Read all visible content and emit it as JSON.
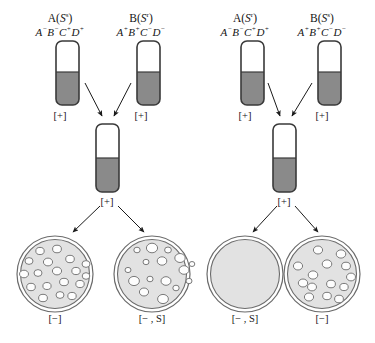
{
  "figure": {
    "colors": {
      "tube_fill": "#8a8a8a",
      "tube_outline": "#3a3a3a",
      "dish_agar": "#e2e2e2",
      "dish_outline": "#6b6b6b",
      "colony_fill": "#fdfdfd",
      "colony_outline": "#7a7a7a",
      "arrow": "#1a1a1a",
      "text": "#141414"
    }
  },
  "experiments": [
    {
      "id": "left",
      "parents": [
        {
          "name_prefix": "A(",
          "name_italic": "S",
          "name_sup": "s",
          "name_suffix": ")",
          "genotype": [
            {
              "gene": "A",
              "sup": "−"
            },
            {
              "gene": "B",
              "sup": "−"
            },
            {
              "gene": "C",
              "sup": "+"
            },
            {
              "gene": "D",
              "sup": "+"
            }
          ],
          "tube_label": "[+]"
        },
        {
          "name_prefix": "B(",
          "name_italic": "S",
          "name_sup": "r",
          "name_suffix": ")",
          "genotype": [
            {
              "gene": "A",
              "sup": "+"
            },
            {
              "gene": "B",
              "sup": "+"
            },
            {
              "gene": "C",
              "sup": "−"
            },
            {
              "gene": "D",
              "sup": "−"
            }
          ],
          "tube_label": "[+]"
        }
      ],
      "mix_tube_label": "[+]",
      "plates": [
        {
          "label": "[−]",
          "colony_count": 18,
          "colony_size": "small",
          "empty": false
        },
        {
          "label": "[− , S]",
          "colony_count": 16,
          "colony_size": "varied",
          "empty": false
        }
      ]
    },
    {
      "id": "right",
      "parents": [
        {
          "name_prefix": "A(",
          "name_italic": "S",
          "name_sup": "r",
          "name_suffix": ")",
          "genotype": [
            {
              "gene": "A",
              "sup": "−"
            },
            {
              "gene": "B",
              "sup": "−"
            },
            {
              "gene": "C",
              "sup": "+"
            },
            {
              "gene": "D",
              "sup": "+"
            }
          ],
          "tube_label": "[+]"
        },
        {
          "name_prefix": "B(",
          "name_italic": "S",
          "name_sup": "s",
          "name_suffix": ")",
          "genotype": [
            {
              "gene": "A",
              "sup": "+"
            },
            {
              "gene": "B",
              "sup": "+"
            },
            {
              "gene": "C",
              "sup": "−"
            },
            {
              "gene": "D",
              "sup": "−"
            }
          ],
          "tube_label": "[+]"
        }
      ],
      "mix_tube_label": "[+]",
      "plates": [
        {
          "label": "[− , S]",
          "colony_count": 0,
          "colony_size": "none",
          "empty": true
        },
        {
          "label": "[−]",
          "colony_count": 14,
          "colony_size": "medium",
          "empty": false
        }
      ]
    }
  ]
}
